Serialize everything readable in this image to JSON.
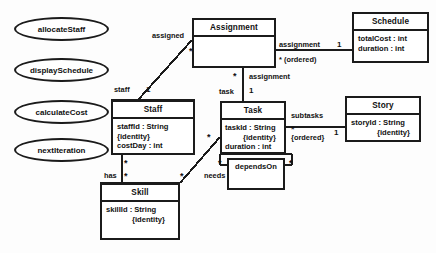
{
  "diagram": {
    "kind": "uml-class-diagram",
    "background_color": "#fdfdfd",
    "line_color": "#1b1b1b"
  },
  "use_cases": [
    {
      "id": "allocate-staff",
      "label": "allocateStaff",
      "x": 14,
      "y": 17,
      "w": 95,
      "h": 24
    },
    {
      "id": "display-schedule",
      "label": "displaySchedule",
      "x": 14,
      "y": 58,
      "w": 95,
      "h": 24
    },
    {
      "id": "calculate-cost",
      "label": "calculateCost",
      "x": 14,
      "y": 100,
      "w": 95,
      "h": 24
    },
    {
      "id": "next-iteration",
      "label": "nextIteration",
      "x": 14,
      "y": 138,
      "w": 95,
      "h": 24
    }
  ],
  "classes": [
    {
      "id": "assignment",
      "name": "Assignment",
      "x": 192,
      "y": 18,
      "w": 84,
      "h": 50,
      "attributes": []
    },
    {
      "id": "schedule",
      "name": "Schedule",
      "x": 352,
      "y": 12,
      "w": 77,
      "h": 51,
      "attributes": [
        {
          "text": "totalCost : int",
          "indented": false
        },
        {
          "text": "duration : int",
          "indented": false
        }
      ]
    },
    {
      "id": "staff",
      "name": "Staff",
      "x": 111,
      "y": 100,
      "w": 84,
      "h": 55,
      "attributes": [
        {
          "text": "staffId : String",
          "indented": false
        },
        {
          "text": "{identity}",
          "indented": true
        },
        {
          "text": "costDay : int",
          "indented": false
        }
      ]
    },
    {
      "id": "task",
      "name": "Task",
      "x": 220,
      "y": 101,
      "w": 66,
      "h": 53,
      "attributes": [
        {
          "text": "taskId : String",
          "indented": false
        },
        {
          "text": "{identity}",
          "indented": true
        },
        {
          "text": "duration : int",
          "indented": false
        }
      ]
    },
    {
      "id": "story",
      "name": "Story",
      "x": 345,
      "y": 96,
      "w": 76,
      "h": 46,
      "attributes": [
        {
          "text": "storyId : String",
          "indented": false
        },
        {
          "text": "{identity}",
          "indented": true
        }
      ]
    },
    {
      "id": "skill",
      "name": "Skill",
      "x": 100,
      "y": 183,
      "w": 80,
      "h": 57,
      "attributes": [
        {
          "text": "skillId : String",
          "indented": false
        },
        {
          "text": "{identity}",
          "indented": true
        }
      ]
    }
  ],
  "self_boxes": [
    {
      "id": "depends-on",
      "label": "dependsOn",
      "x": 227,
      "y": 158,
      "w": 58,
      "h": 32
    }
  ],
  "association_labels": [
    {
      "id": "assigned",
      "text": "assigned",
      "x": 152,
      "y": 31,
      "kind": "role"
    },
    {
      "id": "assigned-star",
      "text": "*",
      "x": 189,
      "y": 48,
      "kind": "mult"
    },
    {
      "id": "staff-role",
      "text": "staff",
      "x": 114,
      "y": 85,
      "kind": "role"
    },
    {
      "id": "staff-one",
      "text": "1",
      "x": 146,
      "y": 86,
      "kind": "mult"
    },
    {
      "id": "assignment-role-top",
      "text": "assignment",
      "x": 279,
      "y": 40,
      "kind": "role"
    },
    {
      "id": "assignment-ordered",
      "text": "* (ordered)",
      "x": 279,
      "y": 55,
      "kind": "role"
    },
    {
      "id": "schedule-one",
      "text": "1",
      "x": 337,
      "y": 40,
      "kind": "mult"
    },
    {
      "id": "assignment-star",
      "text": "*",
      "x": 233,
      "y": 72,
      "kind": "mult"
    },
    {
      "id": "assignment-role-mid",
      "text": "assignment",
      "x": 249,
      "y": 74,
      "kind": "role"
    },
    {
      "id": "task-role",
      "text": "task",
      "x": 219,
      "y": 87,
      "kind": "role"
    },
    {
      "id": "task-one",
      "text": "1",
      "x": 249,
      "y": 88,
      "kind": "mult"
    },
    {
      "id": "subtasks-role",
      "text": "subtasks",
      "x": 291,
      "y": 111,
      "kind": "role"
    },
    {
      "id": "subtasks-star",
      "text": "*",
      "x": 291,
      "y": 125,
      "kind": "mult"
    },
    {
      "id": "subtasks-ordered",
      "text": "{ordered}",
      "x": 291,
      "y": 133,
      "kind": "role"
    },
    {
      "id": "story-one",
      "text": "1",
      "x": 334,
      "y": 128,
      "kind": "mult"
    },
    {
      "id": "has-role",
      "text": "has",
      "x": 104,
      "y": 172,
      "kind": "role"
    },
    {
      "id": "has-star-top",
      "text": "*",
      "x": 124,
      "y": 158,
      "kind": "mult"
    },
    {
      "id": "has-star-bottom",
      "text": "*",
      "x": 124,
      "y": 172,
      "kind": "mult"
    },
    {
      "id": "needs-role",
      "text": "needs",
      "x": 204,
      "y": 172,
      "kind": "role"
    },
    {
      "id": "needs-star-skill",
      "text": "*",
      "x": 180,
      "y": 172,
      "kind": "mult"
    },
    {
      "id": "needs-star-task",
      "text": "*",
      "x": 207,
      "y": 133,
      "kind": "mult"
    },
    {
      "id": "depends-star-left",
      "text": "*",
      "x": 218,
      "y": 160,
      "kind": "mult"
    },
    {
      "id": "depends-star-right",
      "text": "*",
      "x": 289,
      "y": 160,
      "kind": "mult"
    }
  ],
  "connectors": [
    {
      "id": "staff-assignment-line",
      "type": "diagonal"
    },
    {
      "id": "assignment-schedule-line",
      "type": "horizontal"
    },
    {
      "id": "assignment-task-line",
      "type": "vertical"
    },
    {
      "id": "task-story-line",
      "type": "horizontal"
    },
    {
      "id": "staff-skill-line",
      "type": "vertical"
    },
    {
      "id": "task-skill-needs-line",
      "type": "diagonal"
    },
    {
      "id": "task-dependson-line",
      "type": "loop"
    }
  ]
}
